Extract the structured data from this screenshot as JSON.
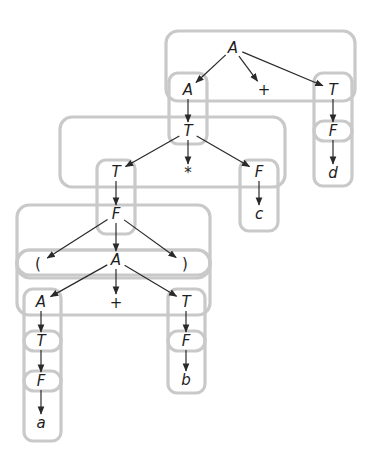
{
  "diagram": {
    "type": "parse-tree",
    "colors": {
      "box_stroke": "#c9c9c9",
      "edge": "#2a2a2a",
      "text": "#1e1e1e"
    },
    "nodes": [
      {
        "id": "n1",
        "label": "A",
        "x": 233,
        "y": 48
      },
      {
        "id": "n2",
        "label": "A",
        "x": 188,
        "y": 90
      },
      {
        "id": "n3",
        "label": "+",
        "x": 264,
        "y": 90
      },
      {
        "id": "n4",
        "label": "T",
        "x": 333,
        "y": 90
      },
      {
        "id": "n5",
        "label": "F",
        "x": 333,
        "y": 131
      },
      {
        "id": "n6",
        "label": "d",
        "x": 333,
        "y": 173
      },
      {
        "id": "n7",
        "label": "T",
        "x": 188,
        "y": 131
      },
      {
        "id": "n8",
        "label": "T",
        "x": 116,
        "y": 172
      },
      {
        "id": "n9",
        "label": "*",
        "x": 188,
        "y": 173
      },
      {
        "id": "n10",
        "label": "F",
        "x": 259,
        "y": 172
      },
      {
        "id": "n11",
        "label": "c",
        "x": 259,
        "y": 214
      },
      {
        "id": "n12",
        "label": "F",
        "x": 116,
        "y": 214
      },
      {
        "id": "n13",
        "label": "(",
        "x": 38,
        "y": 264
      },
      {
        "id": "n14",
        "label": "A",
        "x": 116,
        "y": 260
      },
      {
        "id": "n15",
        "label": ")",
        "x": 185,
        "y": 264
      },
      {
        "id": "n16",
        "label": "A",
        "x": 41,
        "y": 302
      },
      {
        "id": "n17",
        "label": "+",
        "x": 116,
        "y": 303
      },
      {
        "id": "n18",
        "label": "T",
        "x": 186,
        "y": 302
      },
      {
        "id": "n19",
        "label": "T",
        "x": 41,
        "y": 341
      },
      {
        "id": "n20",
        "label": "F",
        "x": 41,
        "y": 381
      },
      {
        "id": "n21",
        "label": "a",
        "x": 41,
        "y": 423
      },
      {
        "id": "n22",
        "label": "F",
        "x": 186,
        "y": 341
      },
      {
        "id": "n23",
        "label": "b",
        "x": 186,
        "y": 380
      }
    ],
    "edges": [
      [
        "n1",
        "n2"
      ],
      [
        "n1",
        "n3"
      ],
      [
        "n1",
        "n4"
      ],
      [
        "n4",
        "n5"
      ],
      [
        "n5",
        "n6"
      ],
      [
        "n2",
        "n7"
      ],
      [
        "n7",
        "n8"
      ],
      [
        "n7",
        "n9"
      ],
      [
        "n7",
        "n10"
      ],
      [
        "n10",
        "n11"
      ],
      [
        "n8",
        "n12"
      ],
      [
        "n12",
        "n13"
      ],
      [
        "n12",
        "n14"
      ],
      [
        "n12",
        "n15"
      ],
      [
        "n14",
        "n16"
      ],
      [
        "n14",
        "n17"
      ],
      [
        "n14",
        "n18"
      ],
      [
        "n16",
        "n19"
      ],
      [
        "n19",
        "n20"
      ],
      [
        "n20",
        "n21"
      ],
      [
        "n18",
        "n22"
      ],
      [
        "n22",
        "n23"
      ]
    ],
    "groups": [
      {
        "name": "level1-expansion",
        "x": 166,
        "y": 31,
        "w": 189,
        "h": 70,
        "r": 12
      },
      {
        "name": "level1-left-column",
        "x": 169,
        "y": 73,
        "w": 38,
        "h": 71,
        "r": 9
      },
      {
        "name": "level1-right-column",
        "x": 314,
        "y": 73,
        "w": 38,
        "h": 113,
        "r": 9
      },
      {
        "name": "level1-right-F",
        "x": 314,
        "y": 121,
        "w": 38,
        "h": 20,
        "r": 10
      },
      {
        "name": "level2-expansion",
        "x": 60,
        "y": 117,
        "w": 225,
        "h": 70,
        "r": 12
      },
      {
        "name": "level2-left-column",
        "x": 97,
        "y": 160,
        "w": 38,
        "h": 74,
        "r": 9
      },
      {
        "name": "level2-right-column",
        "x": 240,
        "y": 160,
        "w": 38,
        "h": 71,
        "r": 9
      },
      {
        "name": "level3-expansion",
        "x": 17,
        "y": 205,
        "w": 193,
        "h": 70,
        "r": 12
      },
      {
        "name": "level3-paren-row",
        "x": 17,
        "y": 250,
        "w": 193,
        "h": 28,
        "r": 13
      },
      {
        "name": "level4-expansion",
        "x": 17,
        "y": 250,
        "w": 193,
        "h": 65,
        "r": 12
      },
      {
        "name": "level4-left-column",
        "x": 24,
        "y": 289,
        "w": 37,
        "h": 152,
        "r": 9
      },
      {
        "name": "level4-left-T",
        "x": 24,
        "y": 331,
        "w": 37,
        "h": 20,
        "r": 10
      },
      {
        "name": "level4-left-F",
        "x": 24,
        "y": 371,
        "w": 37,
        "h": 20,
        "r": 10
      },
      {
        "name": "level4-right-column",
        "x": 168,
        "y": 289,
        "w": 37,
        "h": 104,
        "r": 9
      },
      {
        "name": "level4-right-F",
        "x": 168,
        "y": 331,
        "w": 37,
        "h": 20,
        "r": 10
      }
    ]
  }
}
